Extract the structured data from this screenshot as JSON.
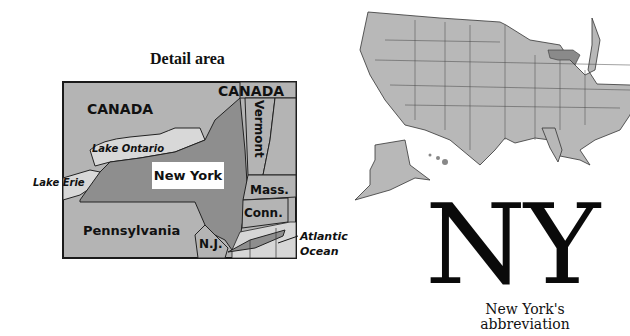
{
  "detail_map": {
    "title": "Detail area",
    "labels": {
      "canada_west": "CANADA",
      "canada_east": "CANADA",
      "lake_ontario": "Lake Ontario",
      "lake_erie": "Lake Erie",
      "new_york": "New York",
      "vermont": "Vermont",
      "massachusetts": "Mass.",
      "connecticut": "Conn.",
      "pennsylvania": "Pennsylvania",
      "new_jersey": "N.J.",
      "atlantic": "Atlantic",
      "ocean": "Ocean"
    },
    "colors": {
      "land": "#b4b4b4",
      "highlight": "#8e8e8e",
      "water": "#d6d6d6",
      "border": "#222222"
    }
  },
  "us_map": {
    "highlighted_state": "New York",
    "land_color": "#b8b8b8",
    "highlight_color": "#8a8a8a"
  },
  "abbreviation": {
    "text": "NY",
    "caption_line1": "New York's",
    "caption_line2": "abbreviation"
  }
}
